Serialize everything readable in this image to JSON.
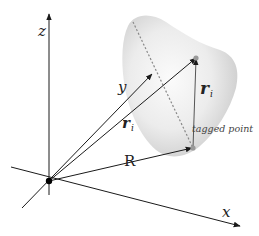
{
  "diagram": {
    "type": "vector-geometry",
    "axes": {
      "x_label": "x",
      "y_label": "y",
      "z_label": "z"
    },
    "vectors": {
      "r_i": {
        "symbol": "r",
        "subscript": "i",
        "style": "bold"
      },
      "R": {
        "symbol": "R"
      },
      "rel_r_i": {
        "symbol": "r",
        "subscript": "i",
        "style": "bold"
      }
    },
    "annotations": {
      "tagged_point": "tagged point"
    },
    "colors": {
      "lines": "#1a1a1a",
      "body_fill": "#d9d9d9",
      "body_highlight": "#f7f7f7",
      "dotted_line": "#888888"
    }
  }
}
